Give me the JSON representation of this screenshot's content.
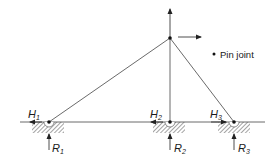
{
  "diagram": {
    "type": "structural-frame",
    "legend": {
      "symbol": "dot",
      "label": "Pin joint"
    },
    "apex_joint": {
      "x": 170,
      "y": 38,
      "loads": [
        "vertical-up-arrow",
        "horizontal-right-arrow"
      ]
    },
    "ground_line": {
      "x1": 20,
      "x2": 265,
      "y": 122
    },
    "supports": [
      {
        "id": "1",
        "x": 49,
        "horizontal_label": "H",
        "horizontal_sub": "1",
        "vertical_label": "R",
        "vertical_sub": "1"
      },
      {
        "id": "2",
        "x": 170,
        "horizontal_label": "H",
        "horizontal_sub": "2",
        "vertical_label": "R",
        "vertical_sub": "2"
      },
      {
        "id": "3",
        "x": 234,
        "horizontal_label": "H",
        "horizontal_sub": "3",
        "vertical_label": "R",
        "vertical_sub": "3"
      }
    ],
    "members": [
      {
        "from": "apex",
        "to": "support-1"
      },
      {
        "from": "apex",
        "to": "support-2"
      },
      {
        "from": "apex",
        "to": "support-3"
      }
    ],
    "colors": {
      "line": "#333333",
      "hatch": "#555555",
      "background": "#ffffff"
    }
  }
}
